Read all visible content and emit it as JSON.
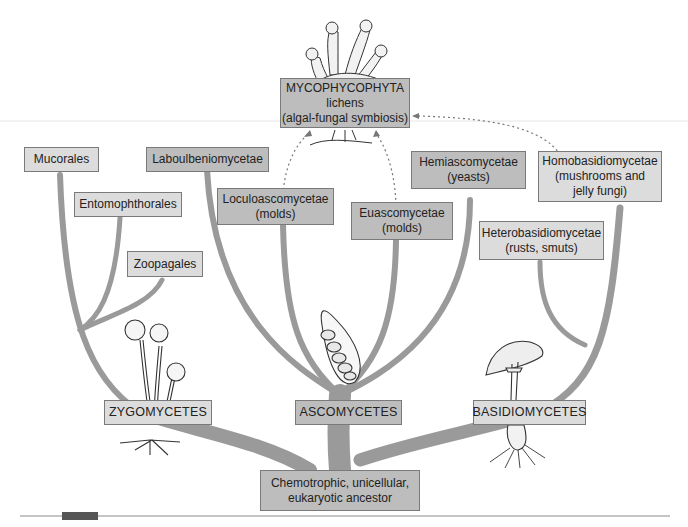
{
  "diagram": {
    "type": "phylogenetic-tree",
    "colors": {
      "branch": "#999999",
      "box_light": "#dcdcdc",
      "box_dark": "#bdbdbd",
      "box_border": "#7a7a7a",
      "text": "#222222",
      "dotted_arrow": "#777777"
    },
    "root": {
      "lines": [
        "Chemotrophic, unicellular,",
        "eukaryotic ancestor"
      ]
    },
    "classes": [
      {
        "name": "ZYGOMYCETES",
        "illustration": "sporangiophores-with-rhizoids",
        "orders": [
          {
            "lines": [
              "Mucorales"
            ]
          },
          {
            "lines": [
              "Entomophthorales"
            ]
          },
          {
            "lines": [
              "Zoopagales"
            ]
          }
        ]
      },
      {
        "name": "ASCOMYCETES",
        "illustration": "ascus-with-ascospores",
        "orders": [
          {
            "lines": [
              "Laboulbeniomycetae"
            ]
          },
          {
            "lines": [
              "Loculoascomycetae",
              "(molds)"
            ]
          },
          {
            "lines": [
              "Euascomycetae",
              "(molds)"
            ]
          },
          {
            "lines": [
              "Hemiascomycetae",
              "(yeasts)"
            ]
          }
        ]
      },
      {
        "name": "BASIDIOMYCETES",
        "illustration": "mushroom-with-mycelium",
        "orders": [
          {
            "lines": [
              "Homobasidiomycetae",
              "(mushrooms and",
              "jelly fungi)"
            ]
          },
          {
            "lines": [
              "Heterobasidiomycetae",
              "(rusts, smuts)"
            ]
          }
        ]
      }
    ],
    "symbiosis": {
      "lines": [
        "MYCOPHYCOPHYTA",
        "lichens",
        "(algal-fungal symbiosis)"
      ],
      "illustration": "lichen-thallus",
      "contributors": [
        "Loculoascomycetae",
        "Euascomycetae",
        "Homobasidiomycetae"
      ]
    }
  }
}
